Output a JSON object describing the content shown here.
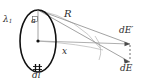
{
  "figure": {
    "background_color": "#ffffff",
    "ink_color": "#2b2b2b",
    "ring_color": "#111111",
    "ray_color": "#8a8a8a",
    "labels": {
      "lambda": "λ",
      "lambda_subscript": "1",
      "angle": "a",
      "radius_line": "R",
      "axis_distance": "x",
      "field_prime": "dE",
      "field_prime_mark": "′",
      "field": "dE",
      "element": "dl"
    },
    "geometry": {
      "ring_center_x": 38,
      "ring_center_y": 41,
      "ring_rx": 18,
      "ring_ry": 31,
      "ring_top_x": 38,
      "ring_top_y": 10,
      "ring_bottom_x": 38,
      "ring_bottom_y": 72,
      "field_point_x": 100,
      "field_point_y": 48,
      "arrow_horizontal_tip_x": 130,
      "arrow_horizontal_tip_y": 44,
      "arrow_diagonal_tip_x": 130,
      "arrow_diagonal_tip_y": 62,
      "dashed_connector_x": 130,
      "dashed_connector_y1": 44,
      "dashed_connector_y2": 62
    }
  }
}
